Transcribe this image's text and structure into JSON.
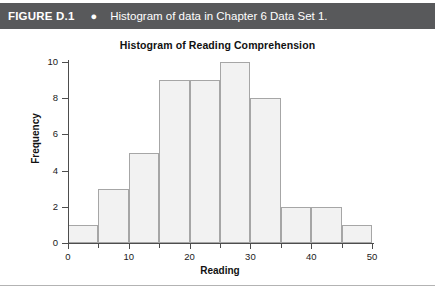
{
  "figure_header": {
    "figure_number": "FIGURE D.1",
    "bullet": "●",
    "caption": "Histogram of data in Chapter 6 Data Set 1.",
    "background_color": "#58595b",
    "text_color": "#ffffff"
  },
  "chart_data": {
    "type": "bar",
    "title": "Histogram of Reading Comprehension",
    "xlabel": "Reading",
    "ylabel": "Frequency",
    "categories": [
      "0-5",
      "5-10",
      "10-15",
      "15-20",
      "20-25",
      "25-30",
      "30-35",
      "35-40",
      "40-45",
      "45-50"
    ],
    "bin_edges": [
      0,
      5,
      10,
      15,
      20,
      25,
      30,
      35,
      40,
      45,
      50
    ],
    "values": [
      1,
      3,
      5,
      9,
      9,
      10,
      8,
      2,
      2,
      1
    ],
    "xlim": [
      0,
      50
    ],
    "ylim": [
      0,
      10
    ],
    "x_ticks_major": [
      0,
      10,
      20,
      30,
      40,
      50
    ],
    "x_ticks_minor": [
      5,
      15,
      25,
      35,
      45
    ],
    "x_tick_labels": [
      "0",
      "10",
      "20",
      "30",
      "40",
      "50"
    ],
    "y_ticks": [
      0,
      2,
      4,
      6,
      8,
      10
    ],
    "y_tick_labels": [
      "0",
      "2",
      "4",
      "6",
      "8",
      "10"
    ],
    "grid": false,
    "legend": null,
    "bar_fill_color": "#f2f2f2",
    "bar_border_color": "#a6a6a6",
    "axis_color": "#4d4d4d"
  }
}
